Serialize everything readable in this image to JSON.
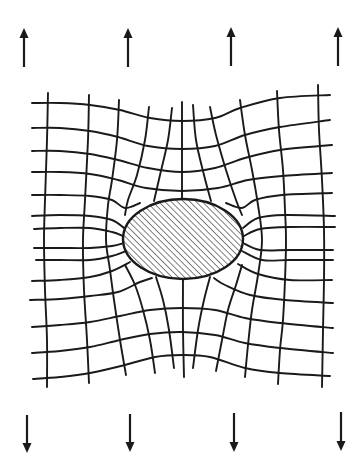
{
  "figure": {
    "colors": {
      "ink": "#1a1a1a",
      "background": "#ffffff"
    }
  },
  "arrows_top": [
    {
      "x": 24,
      "y_tail": 67,
      "y_tip": 28,
      "direction": "up"
    },
    {
      "x": 128,
      "y_tail": 67,
      "y_tip": 28,
      "direction": "up"
    },
    {
      "x": 231,
      "y_tail": 66,
      "y_tip": 27,
      "direction": "up"
    },
    {
      "x": 338,
      "y_tail": 66,
      "y_tip": 27,
      "direction": "up"
    }
  ],
  "arrows_bottom": [
    {
      "x": 27,
      "y_tail": 415,
      "y_tip": 453,
      "direction": "down"
    },
    {
      "x": 130,
      "y_tail": 414,
      "y_tip": 452,
      "direction": "down"
    },
    {
      "x": 234,
      "y_tail": 413,
      "y_tip": 452,
      "direction": "down"
    },
    {
      "x": 341,
      "y_tail": 412,
      "y_tip": 451,
      "direction": "down"
    }
  ],
  "inclusion": {
    "shape": "ellipse",
    "cx": 183,
    "cy": 239,
    "rx": 60,
    "ry": 40,
    "fill": "diagonal-hatch",
    "hatch_spacing": 3.2
  },
  "horizontal_lines": [
    [
      [
        32,
        103
      ],
      [
        60,
        103
      ],
      [
        90,
        105
      ],
      [
        120,
        110
      ],
      [
        150,
        118
      ],
      [
        182,
        121
      ],
      [
        215,
        118
      ],
      [
        240,
        108
      ],
      [
        280,
        98
      ],
      [
        330,
        95
      ]
    ],
    [
      [
        32,
        128
      ],
      [
        60,
        128
      ],
      [
        90,
        131
      ],
      [
        118,
        137
      ],
      [
        148,
        146
      ],
      [
        182,
        149
      ],
      [
        215,
        146
      ],
      [
        245,
        135
      ],
      [
        280,
        127
      ],
      [
        330,
        120
      ]
    ],
    [
      [
        32,
        151
      ],
      [
        60,
        151
      ],
      [
        90,
        154
      ],
      [
        118,
        160
      ],
      [
        148,
        168
      ],
      [
        182,
        172
      ],
      [
        215,
        168
      ],
      [
        245,
        158
      ],
      [
        280,
        150
      ],
      [
        332,
        145
      ]
    ],
    [
      [
        32,
        172
      ],
      [
        60,
        172
      ],
      [
        90,
        174
      ],
      [
        118,
        180
      ],
      [
        146,
        188
      ],
      [
        182,
        191
      ],
      [
        218,
        188
      ],
      [
        248,
        180
      ],
      [
        282,
        176
      ],
      [
        332,
        173
      ]
    ],
    [
      [
        32,
        195
      ],
      [
        60,
        195
      ],
      [
        90,
        196
      ],
      [
        112,
        200
      ],
      [
        125,
        208
      ],
      [
        140,
        203
      ]
    ],
    [
      [
        226,
        203
      ],
      [
        242,
        208
      ],
      [
        255,
        200
      ],
      [
        282,
        195
      ],
      [
        332,
        193
      ]
    ],
    [
      [
        32,
        216
      ],
      [
        60,
        215
      ],
      [
        90,
        216
      ],
      [
        112,
        220
      ],
      [
        124,
        228
      ]
    ],
    [
      [
        243,
        228
      ],
      [
        258,
        218
      ],
      [
        285,
        215
      ],
      [
        335,
        216
      ]
    ],
    [
      [
        34,
        229
      ],
      [
        60,
        228
      ],
      [
        90,
        228
      ],
      [
        112,
        232
      ],
      [
        123,
        236
      ]
    ],
    [
      [
        244,
        236
      ],
      [
        260,
        229
      ],
      [
        290,
        227
      ],
      [
        335,
        227
      ]
    ],
    [
      [
        34,
        248
      ],
      [
        60,
        248
      ],
      [
        90,
        248
      ],
      [
        112,
        246
      ],
      [
        124,
        243
      ]
    ],
    [
      [
        243,
        243
      ],
      [
        260,
        250
      ],
      [
        290,
        250
      ],
      [
        333,
        250
      ]
    ],
    [
      [
        36,
        260
      ],
      [
        60,
        260
      ],
      [
        90,
        260
      ],
      [
        112,
        256
      ],
      [
        126,
        251
      ]
    ],
    [
      [
        242,
        251
      ],
      [
        262,
        260
      ],
      [
        290,
        260
      ],
      [
        333,
        260
      ]
    ],
    [
      [
        32,
        281
      ],
      [
        60,
        280
      ],
      [
        90,
        277
      ],
      [
        112,
        271
      ],
      [
        130,
        262
      ]
    ],
    [
      [
        238,
        264
      ],
      [
        258,
        274
      ],
      [
        290,
        280
      ],
      [
        332,
        280
      ]
    ],
    [
      [
        30,
        300
      ],
      [
        60,
        299
      ],
      [
        90,
        296
      ],
      [
        118,
        292
      ],
      [
        140,
        282
      ],
      [
        152,
        278
      ]
    ],
    [
      [
        214,
        278
      ],
      [
        225,
        285
      ],
      [
        250,
        295
      ],
      [
        285,
        300
      ],
      [
        333,
        303
      ]
    ],
    [
      [
        32,
        327
      ],
      [
        60,
        325
      ],
      [
        90,
        322
      ],
      [
        120,
        316
      ],
      [
        150,
        310
      ],
      [
        182,
        308
      ],
      [
        215,
        310
      ],
      [
        245,
        318
      ],
      [
        280,
        323
      ],
      [
        333,
        328
      ]
    ],
    [
      [
        32,
        353
      ],
      [
        60,
        351
      ],
      [
        90,
        347
      ],
      [
        120,
        340
      ],
      [
        150,
        334
      ],
      [
        182,
        332
      ],
      [
        215,
        335
      ],
      [
        245,
        343
      ],
      [
        280,
        348
      ],
      [
        333,
        353
      ]
    ],
    [
      [
        33,
        379
      ],
      [
        60,
        377
      ],
      [
        90,
        373
      ],
      [
        125,
        365
      ],
      [
        155,
        357
      ],
      [
        182,
        355
      ],
      [
        210,
        357
      ],
      [
        245,
        368
      ],
      [
        280,
        373
      ],
      [
        330,
        376
      ]
    ]
  ],
  "vertical_lines": [
    [
      [
        48,
        93
      ],
      [
        47,
        140
      ],
      [
        45,
        200
      ],
      [
        44,
        240
      ],
      [
        45,
        290
      ],
      [
        47,
        340
      ],
      [
        47,
        387
      ]
    ],
    [
      [
        89,
        95
      ],
      [
        88,
        140
      ],
      [
        85,
        200
      ],
      [
        83,
        240
      ],
      [
        84,
        290
      ],
      [
        87,
        340
      ],
      [
        89,
        383
      ]
    ],
    [
      [
        119,
        100
      ],
      [
        117,
        140
      ],
      [
        112,
        180
      ],
      [
        108,
        205
      ],
      [
        106,
        240
      ],
      [
        110,
        270
      ],
      [
        114,
        300
      ],
      [
        120,
        340
      ],
      [
        126,
        375
      ]
    ],
    [
      [
        149,
        107
      ],
      [
        145,
        140
      ],
      [
        137,
        175
      ],
      [
        128,
        200
      ],
      [
        125,
        215
      ]
    ],
    [
      [
        125,
        265
      ],
      [
        135,
        285
      ],
      [
        143,
        310
      ],
      [
        150,
        340
      ],
      [
        155,
        373
      ]
    ],
    [
      [
        172,
        108
      ],
      [
        168,
        140
      ],
      [
        160,
        175
      ],
      [
        154,
        201
      ]
    ],
    [
      [
        156,
        277
      ],
      [
        163,
        300
      ],
      [
        169,
        330
      ],
      [
        174,
        368
      ]
    ],
    [
      [
        182,
        102
      ],
      [
        182,
        150
      ],
      [
        182,
        199
      ]
    ],
    [
      [
        183,
        279
      ],
      [
        183,
        330
      ],
      [
        184,
        377
      ]
    ],
    [
      [
        193,
        105
      ],
      [
        196,
        140
      ],
      [
        204,
        175
      ],
      [
        211,
        201
      ]
    ],
    [
      [
        210,
        277
      ],
      [
        204,
        300
      ],
      [
        198,
        330
      ],
      [
        193,
        368
      ]
    ],
    [
      [
        210,
        107
      ],
      [
        216,
        135
      ],
      [
        226,
        170
      ],
      [
        236,
        200
      ],
      [
        242,
        215
      ]
    ],
    [
      [
        242,
        265
      ],
      [
        236,
        285
      ],
      [
        228,
        310
      ],
      [
        222,
        340
      ],
      [
        216,
        371
      ]
    ],
    [
      [
        240,
        100
      ],
      [
        245,
        135
      ],
      [
        252,
        170
      ],
      [
        258,
        205
      ],
      [
        262,
        240
      ],
      [
        258,
        275
      ],
      [
        252,
        310
      ],
      [
        248,
        345
      ],
      [
        245,
        377
      ]
    ],
    [
      [
        277,
        91
      ],
      [
        279,
        130
      ],
      [
        283,
        170
      ],
      [
        285,
        210
      ],
      [
        286,
        240
      ],
      [
        285,
        280
      ],
      [
        283,
        320
      ],
      [
        280,
        350
      ],
      [
        278,
        384
      ]
    ],
    [
      [
        318,
        85
      ],
      [
        319,
        130
      ],
      [
        322,
        180
      ],
      [
        324,
        230
      ],
      [
        324,
        280
      ],
      [
        323,
        330
      ],
      [
        322,
        387
      ]
    ]
  ]
}
